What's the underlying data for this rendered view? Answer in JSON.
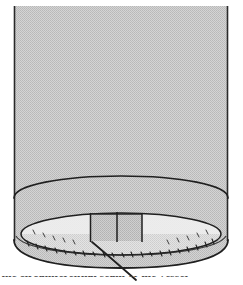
{
  "figure": {
    "kind": "line-drawing",
    "caption_clipped": "the circumferential seam of the vessel",
    "canvas": {
      "width": 243,
      "height": 285
    }
  },
  "colors": {
    "page_background": "#ffffff",
    "body_fill": "#c9c9c9",
    "body_fill_light": "#d6d6d6",
    "inner_disc_fill": "#efefef",
    "panel_fill": "#c4c4c4",
    "outline": "#1f1f1f",
    "outline_soft": "#3a3a3a",
    "caption_text": "#4a4a4a"
  },
  "geometry": {
    "cylinder": {
      "left_edge_x": 14,
      "right_edge_x": 228,
      "top_y": 6,
      "bottom_apex_y": 268,
      "wall_label": "cylinder-wall"
    },
    "rim_ellipse": {
      "center_x": 121,
      "center_y": 198,
      "radius_x": 107,
      "radius_y": 22,
      "label": "outer-rim-ellipse"
    },
    "inner_ellipse": {
      "center_x": 121,
      "center_y": 234,
      "radius_x": 100,
      "radius_y": 21,
      "label": "inner-disc-ellipse"
    },
    "panel_dividers_x": [
      90,
      117,
      142
    ],
    "panel_top_y": 214,
    "panel_bottom_y": 241,
    "leader_line": {
      "x1": 92,
      "y1": 242,
      "x2": 136,
      "y2": 279
    },
    "tick_count": 26
  },
  "labels": {
    "figure_name": "vessel-diagram",
    "outer_wall": "cylinder wall",
    "rim": "rim ellipse",
    "inner_disc": "inner disc",
    "panel_left": "panel segment left",
    "panel_right": "panel segment right",
    "leader": "leader line"
  }
}
